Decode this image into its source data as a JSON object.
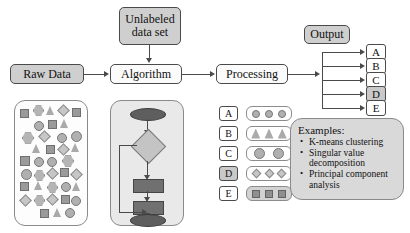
{
  "diagram": {
    "nodes": {
      "raw_data": "Raw Data",
      "unlabeled_line1": "Unlabeled",
      "unlabeled_line2": "data set",
      "algorithm": "Algorithm",
      "processing": "Processing",
      "output": "Output"
    },
    "output_classes": [
      {
        "label": "A",
        "highlighted": false
      },
      {
        "label": "B",
        "highlighted": false
      },
      {
        "label": "C",
        "highlighted": false
      },
      {
        "label": "D",
        "highlighted": true
      },
      {
        "label": "E",
        "highlighted": false
      }
    ],
    "legend": [
      {
        "label": "A",
        "label_filled": false,
        "swatch_filled": false,
        "shape": "circle-small",
        "count": 3
      },
      {
        "label": "B",
        "label_filled": false,
        "swatch_filled": false,
        "shape": "triangle",
        "count": 3
      },
      {
        "label": "C",
        "label_filled": false,
        "swatch_filled": false,
        "shape": "circle-large",
        "count": 2
      },
      {
        "label": "D",
        "label_filled": true,
        "swatch_filled": false,
        "shape": "diamond",
        "count": 3
      },
      {
        "label": "E",
        "label_filled": false,
        "swatch_filled": true,
        "shape": "square",
        "count": 3
      }
    ],
    "examples": {
      "title": "Examples:",
      "items": [
        "K-means clustering",
        "Singular value decomposition",
        "Principal component analysis"
      ]
    },
    "colors": {
      "stroke": "#4a4a4a",
      "fill_gray": "#cfcfcf",
      "panel_gray": "#e9e9e9",
      "examples_gray": "#d9d9d9",
      "shape_gray": "#b0b0b0",
      "flow_dark": "#5e5e5e"
    },
    "raw_data_shapes": [
      {
        "type": "square",
        "x": 5,
        "y": 8
      },
      {
        "type": "hexagon",
        "x": 19,
        "y": 5
      },
      {
        "type": "triangle",
        "x": 32,
        "y": 6
      },
      {
        "type": "diamond",
        "x": 44,
        "y": 5
      },
      {
        "type": "square",
        "x": 58,
        "y": 8
      },
      {
        "type": "circle",
        "x": 19,
        "y": 21
      },
      {
        "type": "square",
        "x": 33,
        "y": 20
      },
      {
        "type": "triangle",
        "x": 46,
        "y": 19
      },
      {
        "type": "hexagon",
        "x": 8,
        "y": 32
      },
      {
        "type": "diamond",
        "x": 25,
        "y": 31
      },
      {
        "type": "circle",
        "x": 43,
        "y": 33
      },
      {
        "type": "circle",
        "x": 57,
        "y": 31
      },
      {
        "type": "triangle",
        "x": 18,
        "y": 44
      },
      {
        "type": "square",
        "x": 31,
        "y": 45
      },
      {
        "type": "diamond",
        "x": 44,
        "y": 44
      },
      {
        "type": "triangle",
        "x": 57,
        "y": 43
      },
      {
        "type": "square",
        "x": 6,
        "y": 56
      },
      {
        "type": "circle",
        "x": 20,
        "y": 57
      },
      {
        "type": "circle",
        "x": 33,
        "y": 57
      },
      {
        "type": "hexagon",
        "x": 48,
        "y": 55
      },
      {
        "type": "circle",
        "x": 7,
        "y": 69
      },
      {
        "type": "hexagon",
        "x": 20,
        "y": 70
      },
      {
        "type": "diamond",
        "x": 33,
        "y": 68
      },
      {
        "type": "square",
        "x": 45,
        "y": 68
      },
      {
        "type": "diamond",
        "x": 58,
        "y": 69
      },
      {
        "type": "square",
        "x": 6,
        "y": 82
      },
      {
        "type": "triangle",
        "x": 20,
        "y": 81
      },
      {
        "type": "hexagon",
        "x": 33,
        "y": 82
      },
      {
        "type": "circle",
        "x": 46,
        "y": 82
      },
      {
        "type": "triangle",
        "x": 58,
        "y": 82
      },
      {
        "type": "diamond",
        "x": 7,
        "y": 95
      },
      {
        "type": "hexagon",
        "x": 20,
        "y": 95
      },
      {
        "type": "diamond",
        "x": 33,
        "y": 94
      },
      {
        "type": "square",
        "x": 46,
        "y": 94
      },
      {
        "type": "circle",
        "x": 57,
        "y": 96
      },
      {
        "type": "square",
        "x": 25,
        "y": 108
      },
      {
        "type": "triangle",
        "x": 38,
        "y": 107
      },
      {
        "type": "circle",
        "x": 50,
        "y": 107
      }
    ]
  }
}
